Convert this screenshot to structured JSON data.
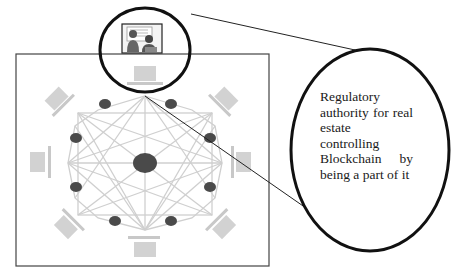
{
  "diagram": {
    "type": "blockchain-network-with-regulator-callout",
    "callout": {
      "text": "Regulatory authority for real estate controlling Blockchain by being a part of it"
    },
    "regulator_icon": "presentation-board-people-icon",
    "network": {
      "center_node": "hub",
      "peer_nodes": 10,
      "laptops": 8,
      "topology": "fully-connected mesh"
    },
    "colors": {
      "outline": "#111111",
      "frame": "#444444",
      "mesh": "#cfcfcf",
      "node": "#4a4a4a",
      "laptop": "#c8c8c8"
    }
  }
}
